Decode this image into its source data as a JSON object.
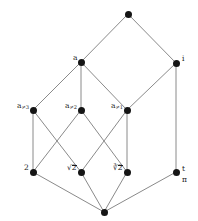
{
  "figure": {
    "background": "#ffffff",
    "node_color": "#151515",
    "edge_color": "#8a8a8a",
    "width": 198,
    "height": 221
  },
  "chart_data": {
    "type": "diagram",
    "subtype": "hasse-lattice",
    "xlabel": "",
    "ylabel": "",
    "grid": false,
    "legend": "none",
    "nodes": [
      {
        "id": "top",
        "label": "",
        "x": 128,
        "y": 14,
        "label_pos": "none"
      },
      {
        "id": "a",
        "label": "a",
        "x": 81,
        "y": 62,
        "label_pos": "left"
      },
      {
        "id": "i",
        "label": "i",
        "x": 176,
        "y": 63,
        "label_pos": "right"
      },
      {
        "id": "aneq3",
        "label": "a",
        "sub": "≠3",
        "x": 33,
        "y": 110,
        "label_pos": "left"
      },
      {
        "id": "aneq2",
        "label": "a",
        "sub": "≠2",
        "x": 81,
        "y": 110,
        "label_pos": "left"
      },
      {
        "id": "aneq1",
        "label": "a",
        "sub": "≠1",
        "x": 127,
        "y": 110,
        "label_pos": "left"
      },
      {
        "id": "two",
        "label": "2",
        "x": 33,
        "y": 172,
        "label_pos": "left"
      },
      {
        "id": "sqrt2",
        "label": "√2",
        "x": 81,
        "y": 172,
        "label_pos": "left"
      },
      {
        "id": "cbrt2",
        "label": "∛2",
        "x": 127,
        "y": 172,
        "label_pos": "left"
      },
      {
        "id": "tpi",
        "label": "t",
        "label2": "π",
        "x": 176,
        "y": 172,
        "label_pos": "right-stack"
      },
      {
        "id": "bottom",
        "label": "",
        "x": 104,
        "y": 212,
        "label_pos": "none"
      }
    ],
    "edges": [
      {
        "from": "top",
        "to": "a"
      },
      {
        "from": "top",
        "to": "i"
      },
      {
        "from": "a",
        "to": "aneq3"
      },
      {
        "from": "a",
        "to": "aneq2"
      },
      {
        "from": "a",
        "to": "aneq1"
      },
      {
        "from": "i",
        "to": "aneq1"
      },
      {
        "from": "i",
        "to": "tpi"
      },
      {
        "from": "aneq3",
        "to": "two"
      },
      {
        "from": "aneq3",
        "to": "sqrt2"
      },
      {
        "from": "aneq2",
        "to": "two"
      },
      {
        "from": "aneq2",
        "to": "cbrt2"
      },
      {
        "from": "aneq1",
        "to": "sqrt2"
      },
      {
        "from": "aneq1",
        "to": "cbrt2"
      },
      {
        "from": "two",
        "to": "bottom"
      },
      {
        "from": "sqrt2",
        "to": "bottom"
      },
      {
        "from": "cbrt2",
        "to": "bottom"
      },
      {
        "from": "tpi",
        "to": "bottom"
      }
    ],
    "labels": {
      "top": "",
      "a": "a",
      "i": "i",
      "aneq3": "a≠3",
      "aneq2": "a≠2",
      "aneq1": "a≠1",
      "two": "2",
      "sqrt2": "√2",
      "cbrt2": "∛2",
      "tpi_upper": "t",
      "tpi_lower": "π",
      "bottom": ""
    }
  }
}
